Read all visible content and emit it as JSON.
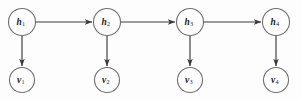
{
  "diagram": {
    "type": "directed-graph",
    "title": "",
    "background_color": "#fdfdfd",
    "node_fill": "#ffffff",
    "node_stroke": "#6e6e6e",
    "edge_color": "#3a3a3a",
    "label_color": "#1a1a1a",
    "hidden_nodes": [
      {
        "id": "h1",
        "base": "h",
        "sub": "1",
        "label": "h1",
        "cx": 22,
        "cy": 22,
        "r": 13.5
      },
      {
        "id": "h2",
        "base": "h",
        "sub": "2",
        "label": "h2",
        "cx": 107,
        "cy": 22,
        "r": 13.5
      },
      {
        "id": "h3",
        "base": "h",
        "sub": "3",
        "label": "h3",
        "cx": 190,
        "cy": 22,
        "r": 13.5
      },
      {
        "id": "h4",
        "base": "h",
        "sub": "4",
        "label": "h4",
        "cx": 276,
        "cy": 22,
        "r": 13.5
      }
    ],
    "visible_nodes": [
      {
        "id": "v1",
        "base": "v",
        "sub": "1",
        "label": "v1",
        "cx": 22,
        "cy": 80,
        "r": 12.5
      },
      {
        "id": "v2",
        "base": "v",
        "sub": "2",
        "label": "v2",
        "cx": 107,
        "cy": 80,
        "r": 12.5
      },
      {
        "id": "v3",
        "base": "v",
        "sub": "3",
        "label": "v3",
        "cx": 190,
        "cy": 80,
        "r": 12.5
      },
      {
        "id": "v4",
        "base": "v",
        "sub": "4",
        "label": "v4",
        "cx": 276,
        "cy": 80,
        "r": 12.5
      }
    ],
    "horizontal_edges": [
      {
        "id": "h1-h2",
        "from": "h1",
        "to": "h2",
        "x1": 36,
        "y1": 22,
        "x2": 92,
        "y2": 22
      },
      {
        "id": "h2-h3",
        "from": "h2",
        "to": "h3",
        "x1": 121,
        "y1": 22,
        "x2": 175,
        "y2": 22
      },
      {
        "id": "h3-h4",
        "from": "h3",
        "to": "h4",
        "x1": 204,
        "y1": 22,
        "x2": 261,
        "y2": 22
      }
    ],
    "vertical_edges": [
      {
        "id": "h1-v1",
        "from": "h1",
        "to": "v1",
        "x1": 22,
        "y1": 36,
        "x2": 22,
        "y2": 66
      },
      {
        "id": "h2-v2",
        "from": "h2",
        "to": "v2",
        "x1": 107,
        "y1": 36,
        "x2": 107,
        "y2": 66
      },
      {
        "id": "h3-v3",
        "from": "h3",
        "to": "v3",
        "x1": 190,
        "y1": 36,
        "x2": 190,
        "y2": 66
      },
      {
        "id": "h4-v4",
        "from": "h4",
        "to": "v4",
        "x1": 276,
        "y1": 36,
        "x2": 276,
        "y2": 66
      }
    ]
  }
}
